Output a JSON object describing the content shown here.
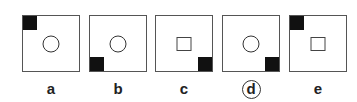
{
  "options": [
    {
      "label": "a",
      "corner": "top-left",
      "shape": "circle",
      "selected": false
    },
    {
      "label": "b",
      "corner": "bottom-left",
      "shape": "circle",
      "selected": false
    },
    {
      "label": "c",
      "corner": "bottom-right",
      "shape": "square",
      "selected": false
    },
    {
      "label": "d",
      "corner": "bottom-right",
      "shape": "circle",
      "selected": true
    },
    {
      "label": "e",
      "corner": "top-left",
      "shape": "square",
      "selected": false
    }
  ]
}
